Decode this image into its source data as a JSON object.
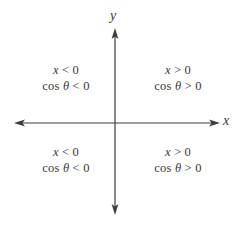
{
  "figure": {
    "background": "#ffffff",
    "axis_color": "#3c3c3c",
    "text_color": "#3a3a3a",
    "axis_labels": {
      "x": "x",
      "y": "y"
    },
    "quadrants": [
      {
        "position": "top-left",
        "x_var": "x",
        "x_op": "<",
        "x_val": "0",
        "fn": "cos",
        "angle": "θ",
        "cos_op": "<",
        "cos_val": "0"
      },
      {
        "position": "top-right",
        "x_var": "x",
        "x_op": ">",
        "x_val": "0",
        "fn": "cos",
        "angle": "θ",
        "cos_op": ">",
        "cos_val": "0"
      },
      {
        "position": "bottom-left",
        "x_var": "x",
        "x_op": "<",
        "x_val": "0",
        "fn": "cos",
        "angle": "θ",
        "cos_op": "<",
        "cos_val": "0"
      },
      {
        "position": "bottom-right",
        "x_var": "x",
        "x_op": ">",
        "x_val": "0",
        "fn": "cos",
        "angle": "θ",
        "cos_op": ">",
        "cos_val": "0"
      }
    ]
  }
}
